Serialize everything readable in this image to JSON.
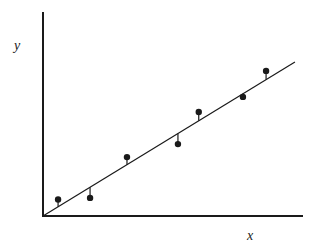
{
  "chart_data": {
    "type": "scatter",
    "title": "",
    "xlabel": "x",
    "ylabel": "y",
    "xlim": [
      0,
      10
    ],
    "ylim": [
      0,
      8
    ],
    "grid": false,
    "legend": null,
    "ticks": false,
    "series": [
      {
        "name": "observations",
        "kind": "scatter",
        "points": [
          {
            "x": 0.58,
            "y": 0.65
          },
          {
            "x": 1.81,
            "y": 0.71
          },
          {
            "x": 3.23,
            "y": 2.31
          },
          {
            "x": 5.19,
            "y": 2.82
          },
          {
            "x": 5.99,
            "y": 4.08
          },
          {
            "x": 7.69,
            "y": 4.67
          },
          {
            "x": 7.69,
            "y": 4.67
          },
          {
            "x": 8.58,
            "y": 5.69
          }
        ]
      },
      {
        "name": "fitted line",
        "kind": "line",
        "points": [
          {
            "x": 0.0,
            "y": 0.0
          },
          {
            "x": 9.69,
            "y": 6.04
          }
        ]
      }
    ],
    "residuals": true,
    "annotations": [
      "vertical residual segments from each point to the fitted line"
    ]
  },
  "labels": {
    "x": "x",
    "y": "y"
  },
  "style": {
    "ink": "#1a1a1a",
    "background": "#ffffff"
  }
}
